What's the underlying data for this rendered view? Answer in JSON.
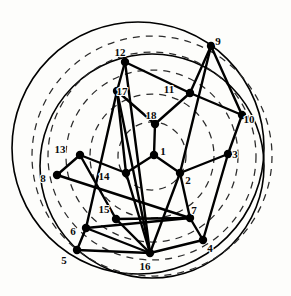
{
  "figure": {
    "type": "node-link-diagram",
    "width": 291,
    "height": 296,
    "background_color": "#fdfdfb",
    "edge_color": "#000000",
    "node_color": "#000000",
    "label_color": "#0a0a0a",
    "dashed_circle_color": "#2b2b2b",
    "solid_circle_color": "#000000"
  },
  "nodes": [
    {
      "id": "1",
      "label": "1",
      "x": 154,
      "y": 155,
      "r": 4.2,
      "label_dx": 9,
      "label_dy": -3
    },
    {
      "id": "2",
      "label": "2",
      "x": 180,
      "y": 173,
      "r": 4.2,
      "label_dx": 8,
      "label_dy": 8
    },
    {
      "id": "3",
      "label": "3",
      "x": 228,
      "y": 154,
      "r": 4.2,
      "label_dx": 7,
      "label_dy": 1
    },
    {
      "id": "4",
      "label": "4",
      "x": 203,
      "y": 240,
      "r": 4.2,
      "label_dx": 7,
      "label_dy": 9
    },
    {
      "id": "5",
      "label": "5",
      "x": 77,
      "y": 250,
      "r": 4.2,
      "label_dx": -13,
      "label_dy": 11
    },
    {
      "id": "6",
      "label": "6",
      "x": 86,
      "y": 228,
      "r": 4.2,
      "label_dx": -13,
      "label_dy": 4
    },
    {
      "id": "7",
      "label": "7",
      "x": 190,
      "y": 218,
      "r": 4.2,
      "label_dx": 4,
      "label_dy": -7
    },
    {
      "id": "8",
      "label": "8",
      "x": 57,
      "y": 175,
      "r": 4.2,
      "label_dx": -14,
      "label_dy": 4
    },
    {
      "id": "9",
      "label": "9",
      "x": 211,
      "y": 46,
      "r": 4.2,
      "label_dx": 7,
      "label_dy": -4
    },
    {
      "id": "10",
      "label": "10",
      "x": 242,
      "y": 115,
      "r": 4.2,
      "label_dx": 7,
      "label_dy": 5
    },
    {
      "id": "11",
      "label": "11",
      "x": 190,
      "y": 93,
      "r": 4.2,
      "label_dx": -21,
      "label_dy": -3
    },
    {
      "id": "12",
      "label": "12",
      "x": 125,
      "y": 62,
      "r": 4.2,
      "label_dx": -5,
      "label_dy": -9
    },
    {
      "id": "13",
      "label": "13",
      "x": 80,
      "y": 155,
      "r": 4.2,
      "label_dx": -20,
      "label_dy": -5
    },
    {
      "id": "14",
      "label": "14",
      "x": 126,
      "y": 173,
      "r": 4.2,
      "label_dx": -22,
      "label_dy": 4
    },
    {
      "id": "15",
      "label": "15",
      "x": 116,
      "y": 219,
      "r": 4.2,
      "label_dx": -12,
      "label_dy": -9
    },
    {
      "id": "16",
      "label": "16",
      "x": 150,
      "y": 253,
      "r": 4.2,
      "label_dx": -5,
      "label_dy": 14
    },
    {
      "id": "17",
      "label": "17",
      "x": 117,
      "y": 91,
      "r": 4.2,
      "label_dx": 5,
      "label_dy": 1
    },
    {
      "id": "18",
      "label": "18",
      "x": 155,
      "y": 124,
      "r": 4.2,
      "label_dx": -4,
      "label_dy": -8
    }
  ],
  "edges": [
    {
      "from": "1",
      "to": "18"
    },
    {
      "from": "1",
      "to": "14"
    },
    {
      "from": "1",
      "to": "2"
    },
    {
      "from": "2",
      "to": "3"
    },
    {
      "from": "2",
      "to": "7"
    },
    {
      "from": "2",
      "to": "9"
    },
    {
      "from": "2",
      "to": "16"
    },
    {
      "from": "3",
      "to": "10"
    },
    {
      "from": "3",
      "to": "4"
    },
    {
      "from": "4",
      "to": "7"
    },
    {
      "from": "4",
      "to": "16"
    },
    {
      "from": "5",
      "to": "6"
    },
    {
      "from": "5",
      "to": "16"
    },
    {
      "from": "6",
      "to": "7"
    },
    {
      "from": "6",
      "to": "16"
    },
    {
      "from": "6",
      "to": "17"
    },
    {
      "from": "7",
      "to": "8"
    },
    {
      "from": "7",
      "to": "15"
    },
    {
      "from": "8",
      "to": "13"
    },
    {
      "from": "9",
      "to": "10"
    },
    {
      "from": "9",
      "to": "11"
    },
    {
      "from": "10",
      "to": "11"
    },
    {
      "from": "11",
      "to": "12"
    },
    {
      "from": "11",
      "to": "18"
    },
    {
      "from": "12",
      "to": "17"
    },
    {
      "from": "12",
      "to": "16"
    },
    {
      "from": "13",
      "to": "14"
    },
    {
      "from": "13",
      "to": "15"
    },
    {
      "from": "14",
      "to": "16"
    },
    {
      "from": "14",
      "to": "17"
    },
    {
      "from": "15",
      "to": "16"
    },
    {
      "from": "17",
      "to": "18"
    },
    {
      "from": "17",
      "to": "16"
    }
  ],
  "dashed_circles": [
    {
      "cx": 152,
      "cy": 156,
      "r": 120
    },
    {
      "cx": 152,
      "cy": 156,
      "r": 104
    },
    {
      "cx": 152,
      "cy": 156,
      "r": 86
    },
    {
      "cx": 152,
      "cy": 156,
      "r": 62
    },
    {
      "cx": 152,
      "cy": 156,
      "r": 34
    }
  ],
  "solid_circles": [
    {
      "cx": 138,
      "cy": 148,
      "r": 126
    },
    {
      "cx": 152,
      "cy": 166,
      "r": 112
    }
  ]
}
